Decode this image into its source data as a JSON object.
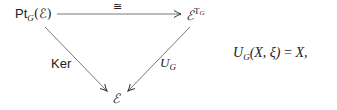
{
  "diagram": {
    "nodes": {
      "top_left": {
        "main": "Pt",
        "sub": "G",
        "arg": "(ℰ)"
      },
      "top_right": {
        "main": "ℰ",
        "sup_main": "T",
        "sup_sub": "G"
      },
      "bottom": {
        "main": "ℰ"
      }
    },
    "arrows": {
      "top": {
        "label": "≅"
      },
      "left": {
        "label": "Ker"
      },
      "right": {
        "label_main": "U",
        "label_sub": "G"
      }
    },
    "equation": {
      "lhs_main": "U",
      "lhs_sub": "G",
      "lhs_args": "(X, ξ)",
      "equals": "=",
      "rhs": "X,"
    }
  }
}
